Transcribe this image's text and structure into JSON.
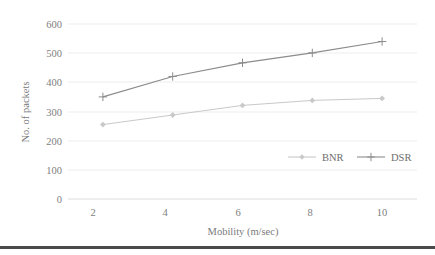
{
  "chart_data": {
    "type": "line",
    "title": "",
    "xlabel": "Mobility (m/sec)",
    "ylabel": "No. of packets",
    "x": [
      2,
      4,
      6,
      8,
      10
    ],
    "xticklabels": [
      "2",
      "4",
      "6",
      "8",
      "10"
    ],
    "yticks": [
      0,
      100,
      200,
      300,
      400,
      500,
      600
    ],
    "yticklabels": [
      "0",
      "100",
      "200",
      "300",
      "400",
      "500",
      "600"
    ],
    "ylim": [
      0,
      600
    ],
    "xlim": [
      1,
      11
    ],
    "grid": "horizontal",
    "legend_position": "inside-lower-right",
    "series": [
      {
        "name": "BNR",
        "values": [
          255,
          288,
          321,
          338,
          345
        ],
        "color": "#c9c9c9",
        "marker": "diamond"
      },
      {
        "name": "DSR",
        "values": [
          350,
          420,
          467,
          501,
          540
        ],
        "color": "#8c8c8c",
        "marker": "plus"
      }
    ]
  },
  "legend": {
    "items": [
      {
        "label": "BNR",
        "color": "#c9c9c9",
        "marker": "diamond"
      },
      {
        "label": "DSR",
        "color": "#8c8c8c",
        "marker": "plus"
      }
    ]
  },
  "axes": {
    "x_title": "Mobility (m/sec)",
    "y_title": "No. of packets"
  },
  "colors": {
    "grid": "#e9e9e9",
    "axis": "#d8d8d8",
    "text": "#808080",
    "rule": "#4a4a4a"
  }
}
